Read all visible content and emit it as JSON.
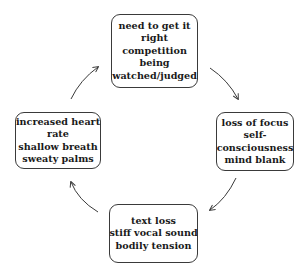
{
  "diagram": {
    "type": "cycle",
    "stroke_color": "#3a3a3a",
    "text_color": "#1a1a1a",
    "nodes": {
      "top": {
        "lines": [
          "need to get it",
          "right",
          "competition",
          "being",
          "watched/judged"
        ]
      },
      "right": {
        "lines": [
          "loss of focus",
          "self-",
          "consciousness",
          "mind blank"
        ]
      },
      "bottom": {
        "lines": [
          "text loss",
          "stiff vocal sound",
          "bodily tension"
        ]
      },
      "left": {
        "lines": [
          "increased heart",
          "rate",
          "shallow breath",
          "sweaty palms"
        ]
      }
    },
    "edges": [
      {
        "from": "top",
        "to": "right",
        "direction": "clockwise"
      },
      {
        "from": "right",
        "to": "bottom",
        "direction": "clockwise"
      },
      {
        "from": "bottom",
        "to": "left",
        "direction": "clockwise"
      },
      {
        "from": "left",
        "to": "top",
        "direction": "clockwise"
      }
    ]
  }
}
